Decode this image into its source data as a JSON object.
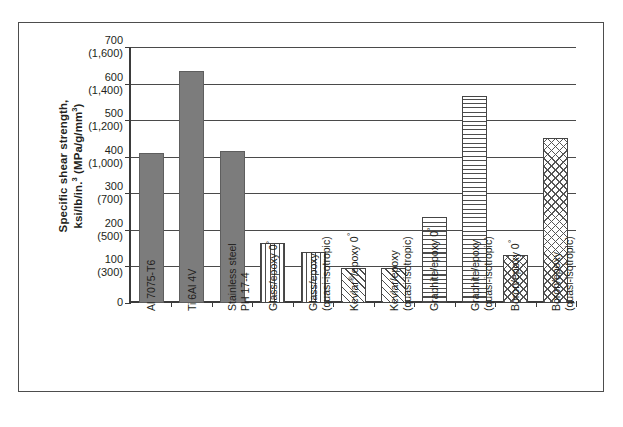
{
  "chart_data": {
    "type": "bar",
    "title": "",
    "xlabel": "",
    "ylabel_lines": [
      "Specific shear strength,",
      "ksi/lb/in.3 (MPa/g/mm3)"
    ],
    "ylim": [
      0,
      700
    ],
    "grid": true,
    "legend": "none",
    "y_ticks": [
      {
        "primary": "700",
        "secondary": "(1,600)",
        "value": 700
      },
      {
        "primary": "600",
        "secondary": "(1,400)",
        "value": 600
      },
      {
        "primary": "500",
        "secondary": "(1,200)",
        "value": 500
      },
      {
        "primary": "400",
        "secondary": "(1,000)",
        "value": 400
      },
      {
        "primary": "300",
        "secondary": "(700)",
        "value": 300
      },
      {
        "primary": "200",
        "secondary": "(500)",
        "value": 200
      },
      {
        "primary": "100",
        "secondary": "(300)",
        "value": 100
      },
      {
        "primary": "0",
        "secondary": "",
        "value": 0
      }
    ],
    "categories": [
      "Al 7075-T6",
      "Ti 6Al 4V",
      "Stainless steel PH 17-4",
      "Glass/epoxy 0°",
      "Glass/epoxy (quasi-isotropic)",
      "Kevlar®/epoxy 0°",
      "Kevlar/epoxy (quasi-isotropic)",
      "Graphite/epoxy 0°",
      "Graphite/epoxy (quasi-isotropic)",
      "Boron/epoxy 0°",
      "Boron/epoxy (quasi-isotropic)"
    ],
    "category_label_lines": [
      [
        "Al 7075-T6"
      ],
      [
        "Ti 6Al 4V"
      ],
      [
        "Stainless steel",
        "PH 17-4"
      ],
      [
        "Glass/epoxy 0°"
      ],
      [
        "Glass/epoxy",
        "(quasi-isotropic)"
      ],
      [
        "Kevlar®/epoxy 0°"
      ],
      [
        "Kevlar/epoxy",
        "(quasi-isotropic)"
      ],
      [
        "Graphite/epoxy 0°"
      ],
      [
        "Graphite/epoxy",
        "(quasi-isotropic)"
      ],
      [
        "Boron/epoxy 0°"
      ],
      [
        "Boron/epoxy",
        "(quasi-isotropic)"
      ]
    ],
    "values": [
      410,
      635,
      415,
      165,
      140,
      95,
      95,
      235,
      565,
      130,
      450
    ],
    "patterns": [
      "solid",
      "solid",
      "solid",
      "vertical",
      "vertical",
      "diagonal",
      "diagonal",
      "horizontal",
      "horizontal",
      "crosshatch",
      "crosshatch"
    ]
  },
  "colors": {
    "solid_fill": "#7c7c7c",
    "line": "#4a4a4a",
    "axis": "#3b3b3b",
    "text": "#231f20",
    "frame": "#4d4d4d"
  }
}
